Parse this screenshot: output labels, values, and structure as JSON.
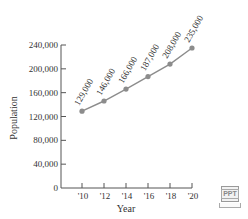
{
  "chart_data": {
    "type": "line",
    "title": "",
    "xlabel": "Year",
    "ylabel": "Population",
    "categories": [
      "'10",
      "'12",
      "'14",
      "'16",
      "'18",
      "'20"
    ],
    "x": [
      2010,
      2012,
      2014,
      2016,
      2018,
      2020
    ],
    "values": [
      129000,
      146000,
      166000,
      187000,
      208000,
      235000
    ],
    "data_labels": [
      "129,000",
      "146,000",
      "166,000",
      "187,000",
      "208,000",
      "235,000"
    ],
    "y_ticks": [
      0,
      40000,
      80000,
      120000,
      160000,
      200000,
      240000
    ],
    "y_tick_labels": [
      "0",
      "40,000",
      "80,000",
      "120,000",
      "160,000",
      "200,000",
      "240,000"
    ],
    "ylim": [
      0,
      240000
    ],
    "grid": false,
    "legend": null,
    "line_color": "#8c8c8c",
    "marker_color": "#8c8c8c"
  },
  "badge": {
    "label": "PPT"
  }
}
